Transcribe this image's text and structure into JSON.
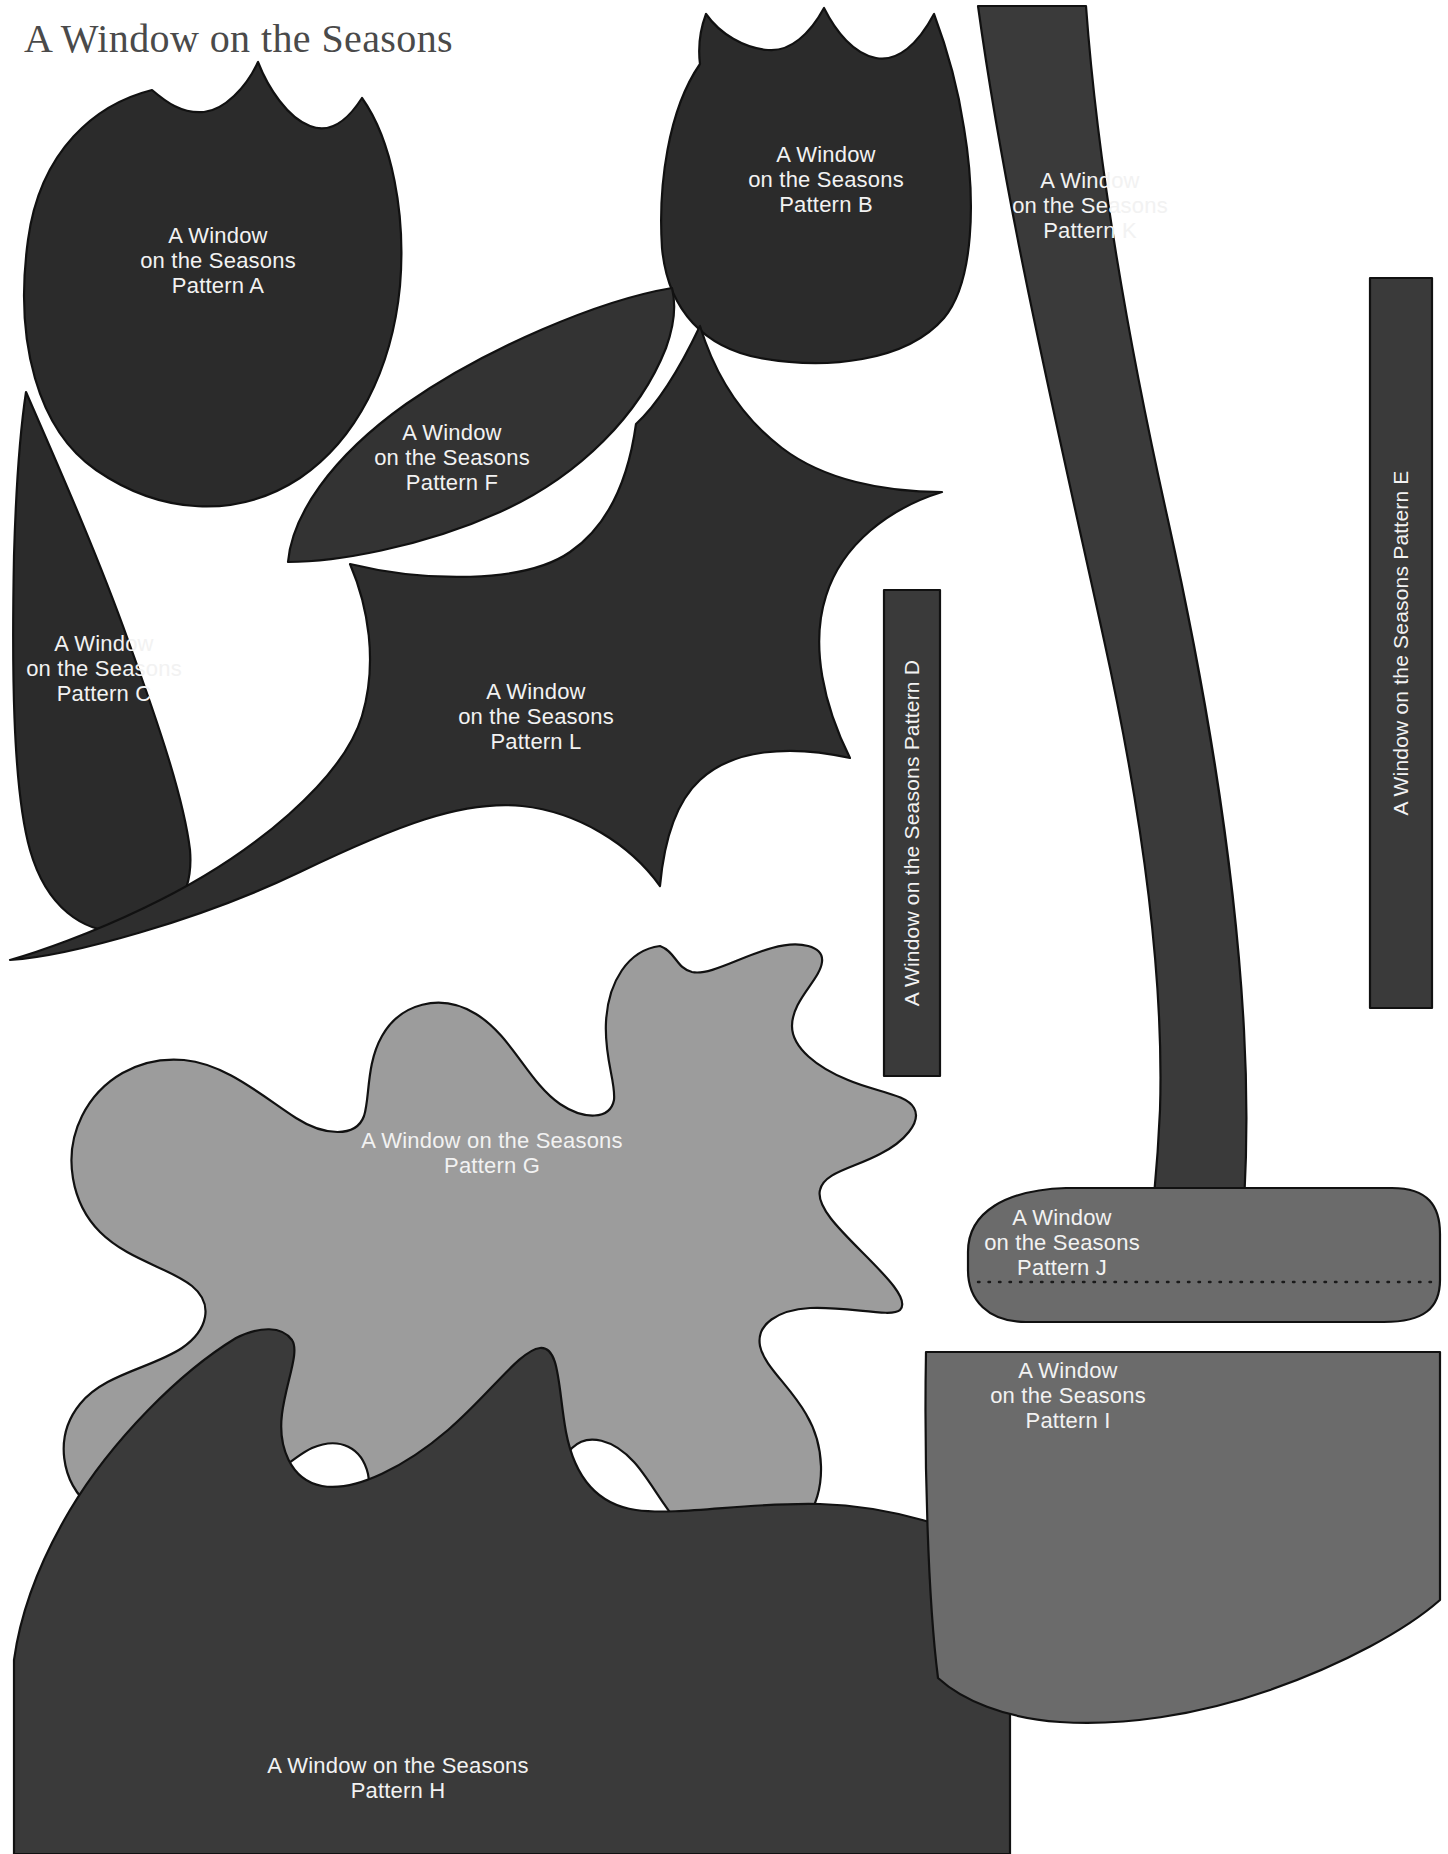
{
  "sheet": {
    "title": "A Window on the Seasons",
    "background_color": "#ffffff",
    "title_color": "#4a4a4a",
    "label_color": "#f2f2f2",
    "outline_color": "#111111",
    "width": 1448,
    "height": 1854
  },
  "brand_line": "A Window on the Seasons",
  "palette": {
    "dark": "#2b2b2b",
    "dark_alt": "#333333",
    "mid_gray": "#6b6b6b",
    "light_gray": "#9c9c9c"
  },
  "pieces": [
    {
      "id": "A",
      "name": "Pattern A",
      "shape": "tulip-flower",
      "fill": "#2b2b2b",
      "label_lines": [
        "A Window",
        "on the Seasons",
        "Pattern A"
      ],
      "label_orientation": "horizontal"
    },
    {
      "id": "B",
      "name": "Pattern B",
      "shape": "tulip-bud",
      "fill": "#2b2b2b",
      "label_lines": [
        "A Window",
        "on the Seasons",
        "Pattern B"
      ],
      "label_orientation": "horizontal"
    },
    {
      "id": "C",
      "name": "Pattern C",
      "shape": "teardrop-petal",
      "fill": "#2b2b2b",
      "label_lines": [
        "A Window",
        "on the Seasons",
        "Pattern C"
      ],
      "label_orientation": "horizontal"
    },
    {
      "id": "D",
      "name": "Pattern D",
      "shape": "narrow-strip",
      "fill": "#3a3a3a",
      "label_lines": [
        "A Window on the Seasons Pattern D"
      ],
      "label_orientation": "vertical"
    },
    {
      "id": "E",
      "name": "Pattern E",
      "shape": "narrow-strip",
      "fill": "#3a3a3a",
      "label_lines": [
        "A Window on the Seasons Pattern E"
      ],
      "label_orientation": "vertical"
    },
    {
      "id": "F",
      "name": "Pattern F",
      "shape": "pointed-leaf",
      "fill": "#333333",
      "label_lines": [
        "A Window",
        "on the Seasons",
        "Pattern F"
      ],
      "label_orientation": "horizontal"
    },
    {
      "id": "G",
      "name": "Pattern G",
      "shape": "oak-leaf",
      "fill": "#9c9c9c",
      "label_lines": [
        "A Window on the Seasons",
        "Pattern G"
      ],
      "label_orientation": "horizontal"
    },
    {
      "id": "H",
      "name": "Pattern H",
      "shape": "scalloped-hill",
      "fill": "#3a3a3a",
      "label_lines": [
        "A Window on the Seasons",
        "Pattern H"
      ],
      "label_orientation": "horizontal"
    },
    {
      "id": "I",
      "name": "Pattern I",
      "shape": "rounded-block",
      "fill": "#6b6b6b",
      "label_lines": [
        "A Window",
        "on the Seasons",
        "Pattern I"
      ],
      "label_orientation": "horizontal"
    },
    {
      "id": "J",
      "name": "Pattern J",
      "shape": "rounded-pillow",
      "fill": "#6b6b6b",
      "label_lines": [
        "A Window",
        "on the Seasons",
        "Pattern J"
      ],
      "label_orientation": "horizontal",
      "has_dotted_seam_line": true
    },
    {
      "id": "K",
      "name": "Pattern K",
      "shape": "wavy-stem",
      "fill": "#3a3a3a",
      "label_lines": [
        "A Window",
        "on the Seasons",
        "Pattern K"
      ],
      "label_orientation": "horizontal"
    },
    {
      "id": "L",
      "name": "Pattern L",
      "shape": "star-holly",
      "fill": "#2e2e2e",
      "label_lines": [
        "A Window",
        "on the Seasons",
        "Pattern L"
      ],
      "label_orientation": "horizontal"
    }
  ]
}
